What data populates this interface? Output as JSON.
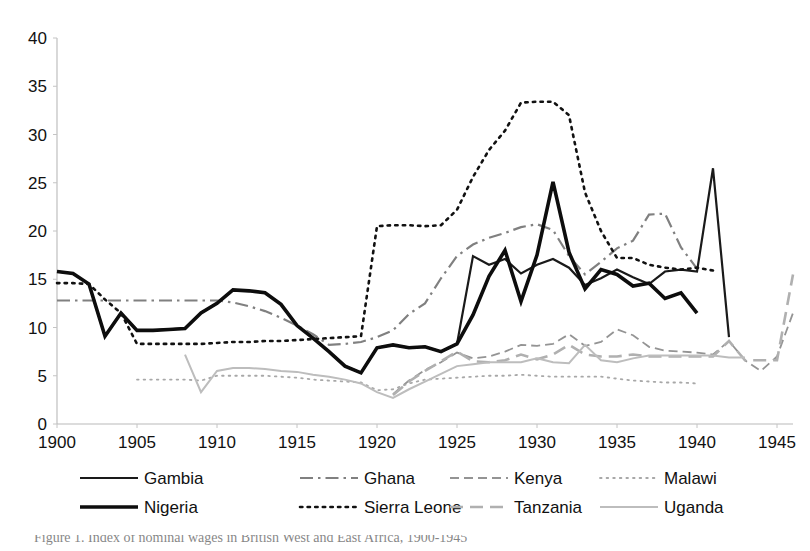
{
  "chart_data": {
    "type": "line",
    "title": "",
    "subtitle": "",
    "xlabel": "",
    "ylabel": "",
    "xlim": [
      1900,
      1946
    ],
    "ylim": [
      0,
      40
    ],
    "yticks": [
      0,
      5,
      10,
      15,
      20,
      25,
      30,
      35,
      40
    ],
    "xticks": [
      1900,
      1905,
      1910,
      1915,
      1920,
      1925,
      1930,
      1935,
      1940,
      1945
    ],
    "grid": false,
    "legend_position": "bottom",
    "legend_columns": 4,
    "series": [
      {
        "name": "Gambia",
        "style": "solid",
        "color": "#1a1a1a",
        "width": 2.2,
        "x": [
          1900,
          1901,
          1902,
          1903,
          1904,
          1905,
          1906,
          1907,
          1908,
          1909,
          1910,
          1911,
          1912,
          1913,
          1914,
          1915,
          1916,
          1917,
          1918,
          1919,
          1920,
          1921,
          1922,
          1923,
          1924,
          1925,
          1926,
          1927,
          1928,
          1929,
          1930,
          1931,
          1932,
          1933,
          1934,
          1935,
          1936,
          1937,
          1938,
          1939,
          1940,
          1941,
          1942
        ],
        "y": [
          15.8,
          15.6,
          14.5,
          9.1,
          11.5,
          9.7,
          9.7,
          9.8,
          9.9,
          11.5,
          12.5,
          13.9,
          13.8,
          13.6,
          12.4,
          10.2,
          8.9,
          7.5,
          6.0,
          5.3,
          7.9,
          8.2,
          7.9,
          8.0,
          7.5,
          8.3,
          17.4,
          16.5,
          17.1,
          15.6,
          16.5,
          17.1,
          16.2,
          14.4,
          15.1,
          16.0,
          15.2,
          14.5,
          15.8,
          16.0,
          15.8,
          26.5,
          9.0
        ]
      },
      {
        "name": "Ghana",
        "style": "dashdot",
        "color": "#808080",
        "width": 2.2,
        "x": [
          1900,
          1901,
          1902,
          1903,
          1904,
          1905,
          1906,
          1907,
          1908,
          1909,
          1910,
          1911,
          1912,
          1913,
          1914,
          1915,
          1916,
          1917,
          1918,
          1919,
          1920,
          1921,
          1922,
          1923,
          1924,
          1925,
          1926,
          1927,
          1928,
          1929,
          1930,
          1931,
          1932,
          1933,
          1934,
          1935,
          1936,
          1937,
          1938,
          1939,
          1940
        ],
        "y": [
          12.8,
          12.8,
          12.8,
          12.8,
          12.8,
          12.8,
          12.8,
          12.8,
          12.8,
          12.8,
          12.8,
          12.6,
          12.2,
          11.7,
          11.0,
          10.2,
          9.3,
          8.2,
          8.3,
          8.5,
          9.0,
          9.7,
          11.4,
          12.5,
          15.1,
          17.4,
          18.6,
          19.3,
          19.8,
          20.4,
          20.7,
          20.1,
          17.4,
          15.5,
          16.8,
          18.2,
          19.0,
          21.7,
          21.8,
          18.3,
          16.1
        ]
      },
      {
        "name": "Kenya",
        "style": "dashed",
        "color": "#949494",
        "width": 1.8,
        "x": [
          1921,
          1922,
          1923,
          1924,
          1925,
          1926,
          1927,
          1928,
          1929,
          1930,
          1931,
          1932,
          1933,
          1934,
          1935,
          1936,
          1937,
          1938,
          1939,
          1940,
          1941,
          1942,
          1943,
          1944,
          1945,
          1946
        ],
        "y": [
          3.1,
          4.5,
          5.6,
          6.4,
          7.4,
          6.8,
          7.0,
          7.5,
          8.2,
          8.1,
          8.3,
          9.3,
          8.1,
          8.5,
          9.8,
          9.2,
          8.0,
          7.6,
          7.5,
          7.4,
          7.2,
          8.6,
          6.6,
          5.5,
          7.0,
          11.5
        ]
      },
      {
        "name": "Malawi",
        "style": "dotted",
        "color": "#a8a8a8",
        "width": 1.8,
        "x": [
          1905,
          1906,
          1907,
          1908,
          1909,
          1910,
          1911,
          1912,
          1913,
          1914,
          1915,
          1916,
          1917,
          1918,
          1919,
          1920,
          1921,
          1922,
          1923,
          1924,
          1925,
          1926,
          1927,
          1928,
          1929,
          1930,
          1931,
          1932,
          1933,
          1934,
          1935,
          1936,
          1937,
          1938,
          1939,
          1940
        ],
        "y": [
          4.6,
          4.6,
          4.6,
          4.6,
          4.5,
          5.0,
          5.0,
          5.0,
          5.0,
          4.9,
          4.8,
          4.6,
          4.5,
          4.4,
          4.3,
          3.5,
          3.6,
          4.2,
          4.6,
          4.7,
          4.8,
          4.9,
          5.0,
          5.0,
          5.1,
          5.0,
          4.9,
          4.9,
          4.9,
          4.9,
          4.7,
          4.5,
          4.4,
          4.3,
          4.3,
          4.2
        ]
      },
      {
        "name": "Nigeria",
        "style": "solid-thick",
        "color": "#0d0d0d",
        "width": 3.6,
        "x": [
          1900,
          1901,
          1902,
          1903,
          1904,
          1905,
          1906,
          1907,
          1908,
          1909,
          1910,
          1911,
          1912,
          1913,
          1914,
          1915,
          1916,
          1917,
          1918,
          1919,
          1920,
          1921,
          1922,
          1923,
          1924,
          1925,
          1926,
          1927,
          1928,
          1929,
          1930,
          1931,
          1932,
          1933,
          1934,
          1935,
          1936,
          1937,
          1938,
          1939,
          1940
        ],
        "y": [
          15.8,
          15.6,
          14.5,
          9.1,
          11.5,
          9.7,
          9.7,
          9.8,
          9.9,
          11.5,
          12.5,
          13.9,
          13.8,
          13.6,
          12.4,
          10.2,
          8.9,
          7.5,
          6.0,
          5.3,
          7.9,
          8.2,
          7.9,
          8.0,
          7.5,
          8.3,
          11.3,
          15.3,
          18.0,
          12.7,
          17.5,
          25.1,
          17.8,
          14.0,
          16.0,
          15.5,
          14.3,
          14.6,
          13.0,
          13.6,
          11.5
        ]
      },
      {
        "name": "Sierra Leone",
        "style": "dotted-bold",
        "color": "#111111",
        "width": 2.6,
        "x": [
          1900,
          1901,
          1902,
          1903,
          1904,
          1905,
          1906,
          1907,
          1908,
          1909,
          1910,
          1911,
          1912,
          1913,
          1914,
          1915,
          1916,
          1917,
          1918,
          1919,
          1920,
          1921,
          1922,
          1923,
          1924,
          1925,
          1926,
          1927,
          1928,
          1929,
          1930,
          1931,
          1932,
          1933,
          1934,
          1935,
          1936,
          1937,
          1938,
          1939,
          1940,
          1941
        ],
        "y": [
          14.6,
          14.6,
          14.5,
          12.9,
          11.5,
          8.3,
          8.3,
          8.3,
          8.3,
          8.3,
          8.4,
          8.5,
          8.5,
          8.6,
          8.6,
          8.7,
          8.8,
          8.9,
          9.0,
          9.1,
          20.5,
          20.6,
          20.6,
          20.5,
          20.6,
          22.2,
          25.6,
          28.4,
          30.4,
          33.3,
          33.4,
          33.4,
          32.0,
          24.0,
          20.0,
          17.2,
          17.2,
          16.5,
          16.2,
          16.0,
          16.2,
          15.9
        ]
      },
      {
        "name": "Tanzania",
        "style": "longdash",
        "color": "#b0b0b0",
        "width": 2.6,
        "x": [
          1921,
          1922,
          1923,
          1924,
          1925,
          1926,
          1927,
          1928,
          1929,
          1930,
          1931,
          1932,
          1933,
          1934,
          1935,
          1936,
          1937,
          1938,
          1939,
          1940,
          1941,
          1942,
          1943,
          1944,
          1945,
          1946
        ],
        "y": [
          3.0,
          4.4,
          5.5,
          6.5,
          7.5,
          6.5,
          6.4,
          6.6,
          7.2,
          6.7,
          7.2,
          8.2,
          7.2,
          7.0,
          7.0,
          7.2,
          7.0,
          7.0,
          7.0,
          7.0,
          7.0,
          8.6,
          6.6,
          6.6,
          6.6,
          15.5
        ]
      },
      {
        "name": "Uganda",
        "style": "solid-light",
        "color": "#bdbdbd",
        "width": 2.0,
        "x": [
          1908,
          1909,
          1910,
          1911,
          1912,
          1913,
          1914,
          1915,
          1916,
          1917,
          1918,
          1919,
          1920,
          1921,
          1922,
          1923,
          1924,
          1925,
          1926,
          1927,
          1928,
          1929,
          1930,
          1931,
          1932,
          1933,
          1934,
          1935,
          1936,
          1937,
          1938,
          1939,
          1940,
          1941,
          1942,
          1943
        ],
        "y": [
          7.2,
          3.3,
          5.5,
          5.8,
          5.8,
          5.7,
          5.5,
          5.4,
          5.1,
          4.9,
          4.6,
          4.2,
          3.3,
          2.7,
          3.6,
          4.4,
          5.2,
          6.0,
          6.2,
          6.4,
          6.4,
          6.4,
          6.8,
          6.4,
          6.3,
          8.2,
          6.6,
          6.4,
          6.8,
          7.1,
          7.1,
          7.1,
          7.1,
          7.1,
          6.9,
          6.9
        ]
      }
    ]
  },
  "axes": {
    "y_tick_labels": [
      "40",
      "35",
      "30",
      "25",
      "20",
      "15",
      "10",
      "5",
      "0"
    ],
    "x_tick_labels": [
      "1900",
      "1905",
      "1910",
      "1915",
      "1920",
      "1925",
      "1930",
      "1935",
      "1940",
      "1945"
    ]
  },
  "legend": {
    "rows": [
      [
        {
          "label": "Gambia",
          "style": "solid",
          "color": "#1a1a1a"
        },
        {
          "label": "Ghana",
          "style": "dashdot",
          "color": "#808080"
        },
        {
          "label": "Kenya",
          "style": "dashed",
          "color": "#949494"
        },
        {
          "label": "Malawi",
          "style": "dotted",
          "color": "#a8a8a8"
        }
      ],
      [
        {
          "label": "Nigeria",
          "style": "solid-thick",
          "color": "#0d0d0d"
        },
        {
          "label": "Sierra Leone",
          "style": "dotted-bold",
          "color": "#111111"
        },
        {
          "label": "Tanzania",
          "style": "longdash",
          "color": "#b0b0b0"
        },
        {
          "label": "Uganda",
          "style": "solid-light",
          "color": "#bdbdbd"
        }
      ]
    ]
  },
  "caption": {
    "text": "Figure 1. Index of nominal wages in British West and East Africa, 1900-1945"
  }
}
